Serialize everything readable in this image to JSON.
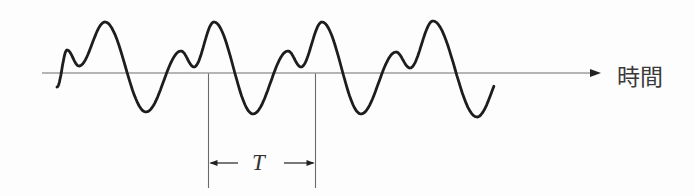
{
  "colors": {
    "background": "#fdfdfd",
    "wave": "#1d1d1d",
    "axis": "#6e6e6e",
    "marker_lines": "#6a6a6a",
    "arrows": "#222222",
    "text": "#3a3a3a"
  },
  "axis": {
    "label": "時間",
    "y": 73,
    "x_start": 42,
    "x_end": 591,
    "arrow_tip_x": 601,
    "arrow_len": 11,
    "arrow_half_height": 3.9
  },
  "wave": {
    "stroke_width": 2.8,
    "clip_end_x": 494,
    "extrema": [
      [
        57,
        87
      ],
      [
        67,
        50
      ],
      [
        79,
        66
      ],
      [
        105,
        22
      ],
      [
        146,
        112
      ],
      [
        181,
        51
      ],
      [
        194,
        67
      ],
      [
        214,
        22
      ],
      [
        253,
        114
      ],
      [
        288,
        51
      ],
      [
        301,
        67
      ],
      [
        322,
        22
      ],
      [
        361,
        114
      ],
      [
        396,
        52
      ],
      [
        410,
        68
      ],
      [
        433,
        21
      ],
      [
        477,
        117
      ],
      [
        506,
        68
      ]
    ]
  },
  "period_marker": {
    "label": "T",
    "x1": 208.5,
    "x2": 315.5,
    "top_y": 73.5,
    "bottom_y": 188,
    "arrow_y": 163,
    "left_arrow_tail_x": 238,
    "right_arrow_tail_x": 284,
    "head_len": 8,
    "head_half_height": 2.9
  },
  "labels": {
    "time": {
      "x": 617,
      "y": 66,
      "size": 23
    },
    "period": {
      "x": 252,
      "y": 151,
      "size": 23
    }
  }
}
